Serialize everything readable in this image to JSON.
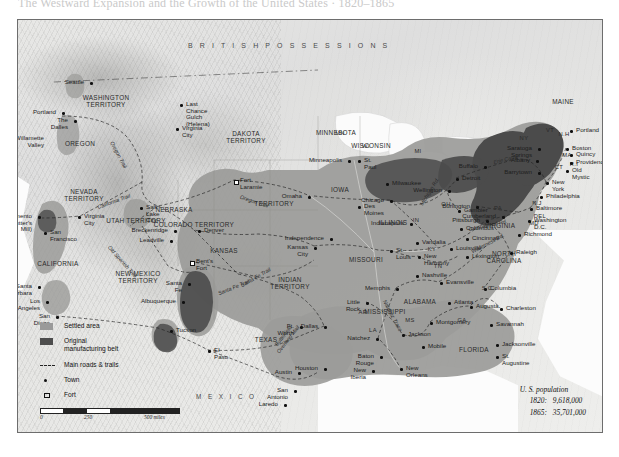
{
  "page": {
    "top_cut_text": "The Westward Expansion and the Growth of the United States · 1820–1865"
  },
  "legend": {
    "items": [
      {
        "key": "settled-area-swatch",
        "label": "Settled area"
      },
      {
        "key": "manufacturing-swatch",
        "label": "Original\nmanufacturing belt"
      },
      {
        "key": "roads-trails-swatch",
        "label": "Main roads & trails"
      },
      {
        "key": "town-swatch",
        "label": "Town"
      },
      {
        "key": "fort-swatch",
        "label": "Fort"
      }
    ],
    "colors": {
      "settled": "#9a9a9a",
      "manufacturing": "#4d4d4d",
      "line": "#222222"
    }
  },
  "scales": {
    "miles": {
      "ticks": [
        "0",
        "250",
        "500 miles"
      ]
    },
    "kilometers": {
      "ticks": [
        "0",
        "250",
        "500 kilometers"
      ]
    }
  },
  "population": {
    "title": "U. S. population",
    "rows": [
      {
        "year": "1820:",
        "value": "9,618,000"
      },
      {
        "year": "1865:",
        "value": "35,701,000"
      }
    ]
  },
  "regions": {
    "british": "B R I T I S H      P O S S E S S I O N S",
    "mexico": "M E X I C O"
  },
  "territories": [
    {
      "name": "WASHINGTON\nTERRITORY",
      "x": 88,
      "y": 82
    },
    {
      "name": "OREGON",
      "x": 62,
      "y": 124
    },
    {
      "name": "DAKOTA\nTERRITORY",
      "x": 228,
      "y": 118
    },
    {
      "name": "NEVADA\nTERRITORY",
      "x": 66,
      "y": 176
    },
    {
      "name": "UTAH TERRITORY",
      "x": 118,
      "y": 201
    },
    {
      "name": "COLORADO TERRITORY",
      "x": 176,
      "y": 205
    },
    {
      "name": "NEBRASKA",
      "x": 156,
      "y": 190
    },
    {
      "name": "TERRITORY",
      "x": 256,
      "y": 184
    },
    {
      "name": "KANSAS",
      "x": 206,
      "y": 231
    },
    {
      "name": "NEW MEXICO\nTERRITORY",
      "x": 120,
      "y": 258
    },
    {
      "name": "CALIFORNIA",
      "x": 40,
      "y": 244
    },
    {
      "name": "INDIAN\nTERRITORY",
      "x": 272,
      "y": 264
    },
    {
      "name": "TEXAS",
      "x": 248,
      "y": 320
    },
    {
      "name": "MINNESOTA",
      "x": 318,
      "y": 113
    },
    {
      "name": "WISCONSIN",
      "x": 353,
      "y": 126
    },
    {
      "name": "IOWA",
      "x": 322,
      "y": 170
    },
    {
      "name": "MISSOURI",
      "x": 348,
      "y": 240
    },
    {
      "name": "ILLINOIS",
      "x": 375,
      "y": 203
    },
    {
      "name": "MISSISSIPPI",
      "x": 367,
      "y": 292
    },
    {
      "name": "ALABAMA",
      "x": 402,
      "y": 282
    },
    {
      "name": "FLORIDA",
      "x": 456,
      "y": 330
    },
    {
      "name": "VIRGINIA",
      "x": 482,
      "y": 206
    },
    {
      "name": "NORTH\nCAROLINA",
      "x": 486,
      "y": 238
    },
    {
      "name": "MAINE",
      "x": 545,
      "y": 82
    }
  ],
  "state_abbrs": [
    {
      "name": "MN",
      "x": 322,
      "y": 113
    },
    {
      "name": "WI",
      "x": 348,
      "y": 126
    },
    {
      "name": "MI",
      "x": 400,
      "y": 131
    },
    {
      "name": "IN",
      "x": 398,
      "y": 200
    },
    {
      "name": "OH",
      "x": 428,
      "y": 184
    },
    {
      "name": "KY",
      "x": 414,
      "y": 229
    },
    {
      "name": "TN",
      "x": 420,
      "y": 246
    },
    {
      "name": "AR",
      "x": 345,
      "y": 292
    },
    {
      "name": "LA",
      "x": 355,
      "y": 310
    },
    {
      "name": "MS",
      "x": 392,
      "y": 300
    },
    {
      "name": "GA",
      "x": 444,
      "y": 300
    },
    {
      "name": "S.C.",
      "x": 470,
      "y": 268
    },
    {
      "name": "PA",
      "x": 480,
      "y": 188
    },
    {
      "name": "N.J",
      "x": 519,
      "y": 183
    },
    {
      "name": "NY",
      "x": 506,
      "y": 118
    },
    {
      "name": "VT",
      "x": 532,
      "y": 110
    },
    {
      "name": "N.H",
      "x": 546,
      "y": 114
    },
    {
      "name": "MA",
      "x": 549,
      "y": 135
    },
    {
      "name": "CT",
      "x": 541,
      "y": 147
    },
    {
      "name": "R.I",
      "x": 556,
      "y": 144
    },
    {
      "name": "DEL",
      "x": 522,
      "y": 196
    },
    {
      "name": "MD",
      "x": 516,
      "y": 203
    }
  ],
  "towns": [
    {
      "name": "Seattle",
      "x": 72,
      "y": 62,
      "marker": "sq",
      "anchor": "right"
    },
    {
      "name": "Portland",
      "x": 44,
      "y": 92,
      "marker": "sq",
      "anchor": "right"
    },
    {
      "name": "The Dalles",
      "x": 56,
      "y": 100,
      "marker": "sq",
      "anchor": "right"
    },
    {
      "name": "Willamette\nValley",
      "x": 32,
      "y": 118,
      "marker": "none",
      "anchor": "right"
    },
    {
      "name": "Last Chance\nGulch (Helena)",
      "x": 162,
      "y": 84,
      "marker": "sq",
      "anchor": "left"
    },
    {
      "name": "Virginia City",
      "x": 158,
      "y": 108,
      "marker": "sq",
      "anchor": "left"
    },
    {
      "name": "Fort Laramie",
      "x": 216,
      "y": 160,
      "marker": "fort",
      "anchor": "left"
    },
    {
      "name": "Sacramento\n(Sutter's Mill)",
      "x": 20,
      "y": 196,
      "marker": "sq",
      "anchor": "right"
    },
    {
      "name": "Virginia City",
      "x": 60,
      "y": 196,
      "marker": "sq",
      "anchor": "left"
    },
    {
      "name": "Salt Lake City",
      "x": 122,
      "y": 187,
      "marker": "sq",
      "anchor": "left"
    },
    {
      "name": "San Francisco",
      "x": 26,
      "y": 212,
      "marker": "sq",
      "anchor": "left"
    },
    {
      "name": "Breckenridge",
      "x": 156,
      "y": 210,
      "marker": "sq",
      "anchor": "right"
    },
    {
      "name": "Leadville",
      "x": 152,
      "y": 220,
      "marker": "sq",
      "anchor": "right"
    },
    {
      "name": "Denver",
      "x": 180,
      "y": 210,
      "marker": "sq",
      "anchor": "left"
    },
    {
      "name": "Bent's Fort",
      "x": 172,
      "y": 241,
      "marker": "fort",
      "anchor": "left"
    },
    {
      "name": "Santa Barbara",
      "x": 20,
      "y": 266,
      "marker": "sq",
      "anchor": "right"
    },
    {
      "name": "Los Angeles",
      "x": 28,
      "y": 281,
      "marker": "sq",
      "anchor": "right"
    },
    {
      "name": "San Diego",
      "x": 38,
      "y": 296,
      "marker": "sq",
      "anchor": "right"
    },
    {
      "name": "Santa Fe",
      "x": 170,
      "y": 263,
      "marker": "sq",
      "anchor": "right"
    },
    {
      "name": "Albuquerque",
      "x": 164,
      "y": 281,
      "marker": "sq",
      "anchor": "right"
    },
    {
      "name": "Tucson",
      "x": 152,
      "y": 310,
      "marker": "sq",
      "anchor": "left"
    },
    {
      "name": "El Paso",
      "x": 190,
      "y": 330,
      "marker": "sq",
      "anchor": "left"
    },
    {
      "name": "Omaha",
      "x": 290,
      "y": 176,
      "marker": "sq",
      "anchor": "right"
    },
    {
      "name": "Kansas City",
      "x": 296,
      "y": 227,
      "marker": "sq",
      "anchor": "right"
    },
    {
      "name": "Independence",
      "x": 312,
      "y": 218,
      "marker": "sq",
      "anchor": "right"
    },
    {
      "name": "Minneapolis",
      "x": 330,
      "y": 140,
      "marker": "sq",
      "anchor": "right"
    },
    {
      "name": "St. Paul",
      "x": 340,
      "y": 140,
      "marker": "sq",
      "anchor": "left"
    },
    {
      "name": "Milwaukee",
      "x": 368,
      "y": 163,
      "marker": "sq",
      "anchor": "left"
    },
    {
      "name": "Des Moines",
      "x": 340,
      "y": 186,
      "marker": "sq",
      "anchor": "left"
    },
    {
      "name": "Chicago",
      "x": 372,
      "y": 180,
      "marker": "sq",
      "anchor": "right"
    },
    {
      "name": "St. Louis",
      "x": 372,
      "y": 230,
      "marker": "sq",
      "anchor": "left"
    },
    {
      "name": "Vandalia",
      "x": 398,
      "y": 222,
      "marker": "sq",
      "anchor": "left"
    },
    {
      "name": "Indianapolis",
      "x": 392,
      "y": 203,
      "marker": "sq",
      "anchor": "right"
    },
    {
      "name": "New Harmony",
      "x": 400,
      "y": 236,
      "marker": "sq",
      "anchor": "left"
    },
    {
      "name": "Evansville",
      "x": 422,
      "y": 262,
      "marker": "sq",
      "anchor": "left"
    },
    {
      "name": "Gambier",
      "x": 440,
      "y": 190,
      "marker": "sq",
      "anchor": "left"
    },
    {
      "name": "Columbus",
      "x": 442,
      "y": 208,
      "marker": "sq",
      "anchor": "left"
    },
    {
      "name": "Cincinnati",
      "x": 448,
      "y": 218,
      "marker": "sq",
      "anchor": "left"
    },
    {
      "name": "Louisville",
      "x": 432,
      "y": 228,
      "marker": "sq",
      "anchor": "left"
    },
    {
      "name": "Lexington",
      "x": 448,
      "y": 236,
      "marker": "sq",
      "anchor": "left"
    },
    {
      "name": "Wellington",
      "x": 430,
      "y": 170,
      "marker": "sq",
      "anchor": "right"
    },
    {
      "name": "Detroit",
      "x": 438,
      "y": 158,
      "marker": "sq",
      "anchor": "left"
    },
    {
      "name": "Buffalo",
      "x": 466,
      "y": 146,
      "marker": "sq",
      "anchor": "right"
    },
    {
      "name": "Burlington",
      "x": 458,
      "y": 186,
      "marker": "sq",
      "anchor": "right"
    },
    {
      "name": "Pittsburgh",
      "x": 468,
      "y": 200,
      "marker": "sq",
      "anchor": "right"
    },
    {
      "name": "Cumberland",
      "x": 484,
      "y": 196,
      "marker": "sq",
      "anchor": "right"
    },
    {
      "name": "Nashville",
      "x": 398,
      "y": 255,
      "marker": "sq",
      "anchor": "left"
    },
    {
      "name": "Memphis",
      "x": 378,
      "y": 268,
      "marker": "sq",
      "anchor": "right"
    },
    {
      "name": "Little Rock",
      "x": 348,
      "y": 282,
      "marker": "sq",
      "anchor": "right"
    },
    {
      "name": "Ft. Worth",
      "x": 282,
      "y": 306,
      "marker": "sq",
      "anchor": "right"
    },
    {
      "name": "Dallas",
      "x": 306,
      "y": 306,
      "marker": "sq",
      "anchor": "right"
    },
    {
      "name": "Natchez",
      "x": 358,
      "y": 318,
      "marker": "sq",
      "anchor": "right"
    },
    {
      "name": "Jackson",
      "x": 384,
      "y": 314,
      "marker": "sq",
      "anchor": "left"
    },
    {
      "name": "Mobile",
      "x": 404,
      "y": 326,
      "marker": "sq",
      "anchor": "left"
    },
    {
      "name": "Baton Rouge",
      "x": 362,
      "y": 336,
      "marker": "sq",
      "anchor": "right"
    },
    {
      "name": "New Orleans",
      "x": 382,
      "y": 348,
      "marker": "sq",
      "anchor": "left"
    },
    {
      "name": "Houston",
      "x": 306,
      "y": 348,
      "marker": "sq",
      "anchor": "right"
    },
    {
      "name": "New Iberia",
      "x": 354,
      "y": 350,
      "marker": "sq",
      "anchor": "right"
    },
    {
      "name": "Austin",
      "x": 280,
      "y": 352,
      "marker": "sq",
      "anchor": "right"
    },
    {
      "name": "San Antonio",
      "x": 276,
      "y": 370,
      "marker": "sq",
      "anchor": "right"
    },
    {
      "name": "Laredo",
      "x": 266,
      "y": 384,
      "marker": "sq",
      "anchor": "right"
    },
    {
      "name": "Montgomery",
      "x": 412,
      "y": 302,
      "marker": "sq",
      "anchor": "left"
    },
    {
      "name": "Atlanta",
      "x": 430,
      "y": 282,
      "marker": "sq",
      "anchor": "left"
    },
    {
      "name": "Augusta",
      "x": 452,
      "y": 286,
      "marker": "sq",
      "anchor": "left"
    },
    {
      "name": "Columbia",
      "x": 466,
      "y": 268,
      "marker": "sq",
      "anchor": "left"
    },
    {
      "name": "Charleston",
      "x": 482,
      "y": 288,
      "marker": "sq",
      "anchor": "left"
    },
    {
      "name": "Savannah",
      "x": 472,
      "y": 304,
      "marker": "sq",
      "anchor": "left"
    },
    {
      "name": "Jacksonville",
      "x": 478,
      "y": 324,
      "marker": "sq",
      "anchor": "left"
    },
    {
      "name": "St. Augustine",
      "x": 478,
      "y": 336,
      "marker": "sq",
      "anchor": "left"
    },
    {
      "name": "Raleigh",
      "x": 492,
      "y": 232,
      "marker": "sq",
      "anchor": "left"
    },
    {
      "name": "Richmond",
      "x": 500,
      "y": 214,
      "marker": "sq",
      "anchor": "left"
    },
    {
      "name": "Washington D.C.",
      "x": 510,
      "y": 200,
      "marker": "sq",
      "anchor": "left"
    },
    {
      "name": "Baltimore",
      "x": 512,
      "y": 188,
      "marker": "sq",
      "anchor": "left"
    },
    {
      "name": "Philadelphia",
      "x": 522,
      "y": 176,
      "marker": "sq",
      "anchor": "left"
    },
    {
      "name": "New York",
      "x": 528,
      "y": 162,
      "marker": "sq",
      "anchor": "left"
    },
    {
      "name": "Old Mystic",
      "x": 548,
      "y": 150,
      "marker": "sq",
      "anchor": "left"
    },
    {
      "name": "Providence",
      "x": 552,
      "y": 142,
      "marker": "sq",
      "anchor": "left"
    },
    {
      "name": "Quincy",
      "x": 552,
      "y": 134,
      "marker": "sq",
      "anchor": "left"
    },
    {
      "name": "Boston",
      "x": 548,
      "y": 128,
      "marker": "sq",
      "anchor": "left"
    },
    {
      "name": "Portland",
      "x": 552,
      "y": 110,
      "marker": "sq",
      "anchor": "left"
    },
    {
      "name": "Saratoga Springs",
      "x": 520,
      "y": 128,
      "marker": "sq",
      "anchor": "right"
    },
    {
      "name": "Albany",
      "x": 518,
      "y": 140,
      "marker": "sq",
      "anchor": "right"
    },
    {
      "name": "Barrytown",
      "x": 520,
      "y": 152,
      "marker": "sq",
      "anchor": "right"
    }
  ],
  "trails": [
    {
      "name": "Oregon Trail",
      "x": 100,
      "y": 135,
      "rot": 62
    },
    {
      "name": "Oregon Trail",
      "x": 236,
      "y": 182,
      "rot": 18
    },
    {
      "name": "California Trail",
      "x": 96,
      "y": 182,
      "rot": -20
    },
    {
      "name": "Old Spanish Trail",
      "x": 104,
      "y": 242,
      "rot": 48
    },
    {
      "name": "Santa Fe Trail",
      "x": 216,
      "y": 268,
      "rot": -22
    },
    {
      "name": "Santa Fe Trail",
      "x": 238,
      "y": 258,
      "rot": -30
    },
    {
      "name": "Butterfield\nOverland Mail",
      "x": 268,
      "y": 318,
      "rot": -52
    },
    {
      "name": "Natchez Trace",
      "x": 374,
      "y": 296,
      "rot": 62
    },
    {
      "name": "Wilderness Rd.",
      "x": 470,
      "y": 224,
      "rot": -28
    },
    {
      "name": "Cumberland Rd.",
      "x": 470,
      "y": 206,
      "rot": -12
    },
    {
      "name": "Erie Canal",
      "x": 488,
      "y": 140,
      "rot": -14
    },
    {
      "name": "Michigan Rd.",
      "x": 412,
      "y": 172,
      "rot": -58
    }
  ]
}
